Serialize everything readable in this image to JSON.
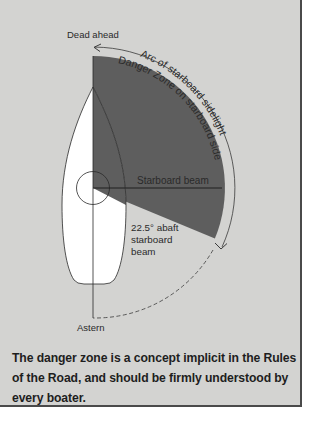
{
  "diagram": {
    "labels": {
      "dead_ahead": "Dead ahead",
      "arc_sidelight": "Arc of starboard sidelight",
      "danger_zone": "Danger Zone on starboard side",
      "starboard_beam": "Starboard beam",
      "abaft_line1": "22.5° abaft",
      "abaft_line2": "starboard",
      "abaft_line3": "beam",
      "astern": "Astern"
    },
    "colors": {
      "background": "#d3d3d1",
      "danger_zone": "#5e5e5e",
      "hull": "#ffffff",
      "line": "#2a2a2a",
      "border": "#4a4a4a"
    }
  },
  "caption": {
    "text": "The danger zone is a concept implicit in the Rules of the Road, and should be firmly understood by every boater."
  }
}
